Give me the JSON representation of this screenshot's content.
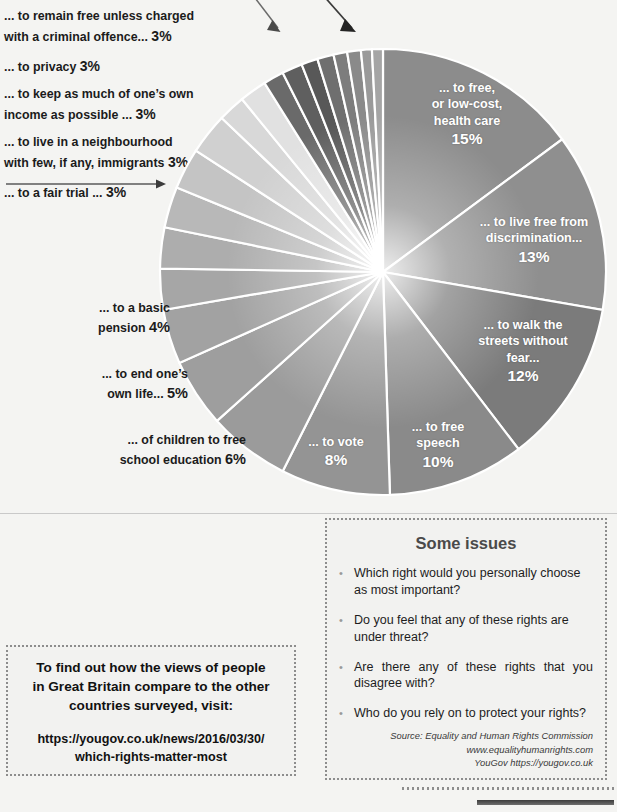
{
  "chart_data": {
    "type": "pie",
    "units": "%",
    "start_angle_deg": 0,
    "direction": "clockwise",
    "legend": "labels placed on slices and outside",
    "slices": [
      {
        "label": "... to free, or low-cost, health care",
        "value": 15,
        "pct_text": "15%",
        "placement": "inside",
        "color": "#8c8c8c"
      },
      {
        "label": "... to live free from discrimination...",
        "value": 13,
        "pct_text": "13%",
        "placement": "inside",
        "color": "#8f8f8f"
      },
      {
        "label": "... to walk the streets without fear...",
        "value": 12,
        "pct_text": "12%",
        "placement": "inside",
        "color": "#7b7b7b"
      },
      {
        "label": "... to free speech",
        "value": 10,
        "pct_text": "10%",
        "placement": "inside",
        "color": "#8a8a8a"
      },
      {
        "label": "... to vote",
        "value": 8,
        "pct_text": "8%",
        "placement": "inside",
        "color": "#949494"
      },
      {
        "label": "... of children to free school education",
        "value": 6,
        "pct_text": "6%",
        "placement": "outside",
        "color": "#9b9b9b"
      },
      {
        "label": "... to end one's own life...",
        "value": 5,
        "pct_text": "5%",
        "placement": "outside",
        "color": "#9e9e9e"
      },
      {
        "label": "... to a basic pension",
        "value": 4,
        "pct_text": "4%",
        "placement": "outside",
        "color": "#a2a2a2"
      },
      {
        "label": "... to a fair trial ...",
        "value": 3,
        "pct_text": "3%",
        "placement": "list",
        "color": "#a6a6a6"
      },
      {
        "label": "... to live in a neighbourhood with few, if any, immigrants",
        "value": 3,
        "pct_text": "3%",
        "placement": "list",
        "color": "#adadad"
      },
      {
        "label": "... to keep as much of one's own income as possible ...",
        "value": 3,
        "pct_text": "3%",
        "placement": "list",
        "color": "#b8b8b8"
      },
      {
        "label": "... to privacy",
        "value": 3,
        "pct_text": "3%",
        "placement": "list",
        "color": "#c4c4c4"
      },
      {
        "label": "... to remain free unless charged with a criminal offence...",
        "value": 3,
        "pct_text": "3%",
        "placement": "list",
        "color": "#d0d0d0"
      },
      {
        "label": "unlabelled slice",
        "value": 2,
        "pct_text": "",
        "placement": "none",
        "color": "#d8d8d8"
      },
      {
        "label": "unlabelled slice",
        "value": 2,
        "pct_text": "",
        "placement": "none",
        "color": "#dededede"
      },
      {
        "label": "unlabelled thin slice",
        "value": 1.5,
        "pct_text": "",
        "placement": "none",
        "color": "#6a6a6a"
      },
      {
        "label": "unlabelled thin slice",
        "value": 1.5,
        "pct_text": "",
        "placement": "none",
        "color": "#5f5f5f"
      },
      {
        "label": "unlabelled thin slice",
        "value": 1.2,
        "pct_text": "",
        "placement": "none",
        "color": "#585858"
      },
      {
        "label": "unlabelled thin slice",
        "value": 1.2,
        "pct_text": "",
        "placement": "none",
        "color": "#6f6f6f"
      },
      {
        "label": "unlabelled thin slice",
        "value": 1.0,
        "pct_text": "",
        "placement": "none",
        "color": "#7d7d7d"
      },
      {
        "label": "unlabelled thin slice",
        "value": 1.0,
        "pct_text": "",
        "placement": "none",
        "color": "#8a8a8a"
      },
      {
        "label": "unlabelled thin slice",
        "value": 0.8,
        "pct_text": "",
        "placement": "none",
        "color": "#9a9a9a"
      },
      {
        "label": "unlabelled thin slice",
        "value": 0.8,
        "pct_text": "",
        "placement": "none",
        "color": "#a5a5a5"
      }
    ]
  },
  "left_labels": [
    {
      "text_a": "... to remain free unless charged",
      "text_b": "with a criminal offence...",
      "pct": "3%"
    },
    {
      "text_a": "... to privacy",
      "text_b": "",
      "pct": "3%"
    },
    {
      "text_a": "... to keep as much of one’s own",
      "text_b": "income as possible ...",
      "pct": "3%"
    },
    {
      "text_a": "... to live in a neighbourhood",
      "text_b": "with few, if any, immigrants",
      "pct": "3%"
    },
    {
      "text_a": "... to a fair trial ...",
      "text_b": "",
      "pct": "3%"
    }
  ],
  "inside_labels": [
    {
      "l1": "... to free,",
      "l2": "or low-cost,",
      "l3": "health care",
      "pct": "15%"
    },
    {
      "l1": "... to live free from",
      "l2": "discrimination...",
      "l3": "",
      "pct": "13%"
    },
    {
      "l1": "... to walk the",
      "l2": "streets without",
      "l3": "fear...",
      "pct": "12%"
    },
    {
      "l1": "... to free",
      "l2": "speech",
      "l3": "",
      "pct": "10%"
    },
    {
      "l1": "... to vote",
      "l2": "",
      "l3": "",
      "pct": "8%"
    }
  ],
  "outside_labels": [
    {
      "l1": "... to a basic",
      "l2": "pension",
      "pct": "4%"
    },
    {
      "l1": "... to end one’s",
      "l2": "own life...",
      "pct": "5%"
    },
    {
      "l1": "... of children to free",
      "l2": "school education",
      "pct": "6%"
    }
  ],
  "issues": {
    "title": "Some issues",
    "items": [
      "Which right would you personally choose as most important?",
      "Do you feel that any of these rights are under threat?",
      "Are there any of these rights that you disagree with?",
      "Who do you rely on to protect your rights?"
    ],
    "bullet": "•",
    "source_line1": "Source: Equality and Human Rights Commission",
    "source_line2": "www.equalityhumanrights.com",
    "source_line3": "YouGov  https://yougov.co.uk"
  },
  "findout": {
    "head_l1": "To find out how the views of people",
    "head_l2": "in Great Britain compare to the other",
    "head_l3": "countries surveyed, visit:",
    "url_l1": "https://yougov.co.uk/news/2016/03/30/",
    "url_l2": "which-rights-matter-most"
  },
  "colors": {
    "page_bg": "#f4f4f2",
    "box_border": "#8d8d8d",
    "box_bg": "#f2f2f0",
    "title_gray": "#4a4a4a",
    "slice_separator": "#ffffff"
  }
}
